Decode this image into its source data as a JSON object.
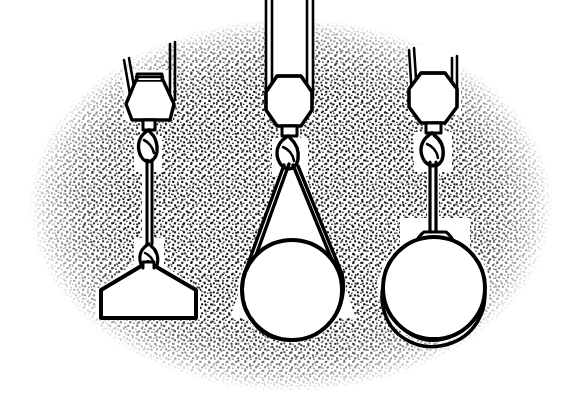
{
  "figure": {
    "background_color": "#ffffff",
    "ink_color": "#000000",
    "stipple_color": "#101010",
    "vignette": {
      "shape": "ellipse",
      "center_x": 291,
      "center_y": 205,
      "radius_x": 262,
      "radius_y": 187,
      "fill": "stipple-dots"
    }
  },
  "rigs": [
    {
      "id": "rig-left",
      "label": "single-leg-rope-with-lower-hook",
      "center_x": 148,
      "hoist_rope_type": "twin-parallel-reeving",
      "hook_block_shape": "trapezoid",
      "sling_type": "single vertical rope with bottom hook",
      "load_shape": "trapezoid-block",
      "load_center_x": 148,
      "load_center_y": 290
    },
    {
      "id": "rig-middle",
      "label": "basket-sling-on-cylinder",
      "center_x": 288,
      "hoist_rope_type": "twin-parallel-reeving",
      "hook_block_shape": "hexagon",
      "sling_type": "endless basket sling",
      "load_shape": "circle-cylinder",
      "load_center_x": 292,
      "load_center_y": 290
    },
    {
      "id": "rig-right",
      "label": "choker-sling-on-cylinder",
      "center_x": 432,
      "hoist_rope_type": "twin-parallel-reeving",
      "hook_block_shape": "hexagon",
      "sling_type": "choker hitch sling",
      "load_shape": "circle-cylinder",
      "load_center_x": 434,
      "load_center_y": 288
    }
  ],
  "caption": ""
}
